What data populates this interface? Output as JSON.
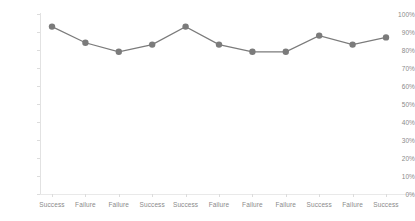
{
  "chart_data": {
    "type": "line",
    "title": "",
    "xlabel": "",
    "ylabel": "",
    "categories": [
      "Success",
      "Failure",
      "Failure",
      "Success",
      "Success",
      "Failure",
      "Failure",
      "Failure",
      "Success",
      "Failure",
      "Success"
    ],
    "values": [
      93,
      84,
      79,
      83,
      93,
      83,
      79,
      79,
      88,
      83,
      87
    ],
    "value_unit": "%",
    "ylim": [
      0,
      100
    ],
    "y_ticks": [
      0,
      10,
      20,
      30,
      40,
      50,
      60,
      70,
      80,
      90,
      100
    ],
    "y_tick_labels": [
      "0%",
      "10%",
      "20%",
      "30%",
      "40%",
      "50%",
      "60%",
      "70%",
      "80%",
      "90%",
      "100%"
    ],
    "grid": false,
    "legend": false,
    "legend_position": "none",
    "series_color": "#7b7b7b",
    "marker": "circle",
    "axis_color": "#e2e2e2",
    "tick_label_color": "#8a8a8a",
    "background": "#ffffff"
  }
}
